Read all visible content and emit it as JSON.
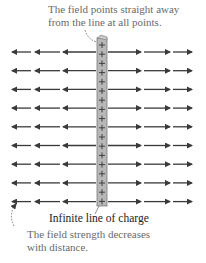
{
  "diagram": {
    "top_annotation": [
      "The field points straight away",
      "from the line at all points."
    ],
    "line_label": "Infinite line of charge",
    "bottom_annotation": [
      "The field strength decreases",
      "with distance."
    ],
    "charge_symbol": "+",
    "colors": {
      "arrow": "#3a3a3a",
      "rod_fill": "#b8b8b8",
      "rod_edge": "#7a7a7a",
      "annotation_text": "#6a6a6a",
      "label_text": "#222222"
    },
    "rows": 9,
    "charges_on_rod": 18
  }
}
